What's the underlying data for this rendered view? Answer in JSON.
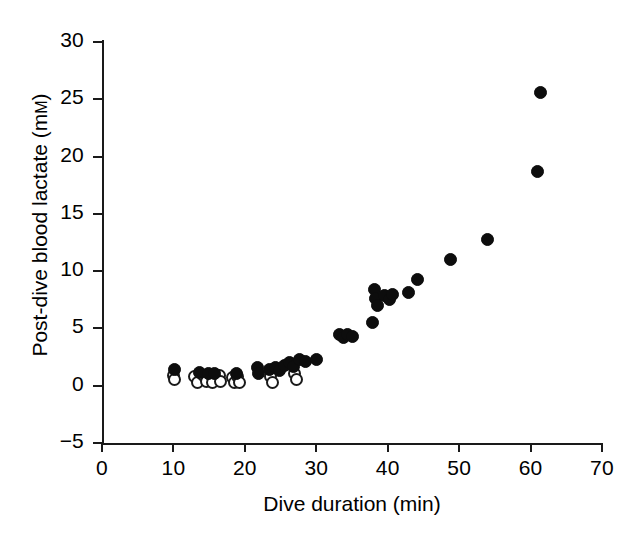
{
  "chart_data": {
    "type": "scatter",
    "title": "",
    "xlabel": "Dive duration (min)",
    "ylabel": "Post-dive blood lactate (mM)",
    "ylabel_main": "Post-dive blood lactate (m",
    "ylabel_smallcap": "M",
    "ylabel_close": ")",
    "xlim": [
      0,
      70
    ],
    "ylim": [
      -5,
      30
    ],
    "xticks": [
      0,
      10,
      20,
      30,
      40,
      50,
      60,
      70
    ],
    "yticks": [
      -5,
      0,
      5,
      10,
      15,
      20,
      25,
      30
    ],
    "xtick_labels": [
      "0",
      "10",
      "20",
      "30",
      "40",
      "50",
      "60",
      "70"
    ],
    "ytick_labels": [
      "−5",
      "0",
      "5",
      "10",
      "15",
      "20",
      "25",
      "30"
    ],
    "grid": false,
    "legend": "none",
    "marker_size_px": 13,
    "series": [
      {
        "name": "open-circles",
        "marker": "open circle",
        "fill": "#ffffff",
        "edge": "#1a1a1a",
        "points": [
          [
            10.0,
            0.9
          ],
          [
            10.2,
            0.5
          ],
          [
            13.0,
            0.8
          ],
          [
            13.4,
            0.3
          ],
          [
            14.2,
            0.9
          ],
          [
            14.6,
            0.4
          ],
          [
            15.3,
            0.9
          ],
          [
            15.5,
            0.3
          ],
          [
            16.4,
            0.9
          ],
          [
            16.6,
            0.35
          ],
          [
            18.2,
            0.75
          ],
          [
            18.5,
            0.25
          ],
          [
            19.0,
            0.8
          ],
          [
            19.3,
            0.3
          ],
          [
            23.6,
            0.8
          ],
          [
            23.9,
            0.3
          ],
          [
            26.9,
            1.05
          ],
          [
            27.2,
            0.55
          ]
        ]
      },
      {
        "name": "filled-circles",
        "marker": "filled circle",
        "fill": "#0d0d0d",
        "edge": "#0d0d0d",
        "points": [
          [
            10.1,
            1.4
          ],
          [
            13.7,
            1.15
          ],
          [
            14.9,
            1.1
          ],
          [
            15.8,
            1.05
          ],
          [
            18.8,
            1.1
          ],
          [
            21.7,
            1.6
          ],
          [
            21.9,
            1.1
          ],
          [
            23.5,
            1.45
          ],
          [
            24.3,
            1.55
          ],
          [
            24.9,
            1.3
          ],
          [
            25.5,
            1.75
          ],
          [
            26.2,
            2.0
          ],
          [
            26.8,
            1.65
          ],
          [
            27.6,
            2.25
          ],
          [
            28.5,
            2.15
          ],
          [
            30.0,
            2.25
          ],
          [
            33.2,
            4.5
          ],
          [
            33.8,
            4.2
          ],
          [
            34.4,
            4.5
          ],
          [
            35.0,
            4.3
          ],
          [
            37.9,
            5.5
          ],
          [
            38.1,
            8.4
          ],
          [
            38.3,
            7.6
          ],
          [
            38.6,
            7.0
          ],
          [
            39.6,
            7.9
          ],
          [
            40.3,
            7.5
          ],
          [
            40.6,
            8.0
          ],
          [
            42.9,
            8.1
          ],
          [
            44.1,
            9.3
          ],
          [
            48.8,
            11.0
          ],
          [
            53.9,
            12.8
          ],
          [
            61.0,
            18.7
          ],
          [
            61.4,
            25.6
          ]
        ]
      }
    ]
  },
  "axis": {
    "line_color": "#1a1a1a"
  }
}
